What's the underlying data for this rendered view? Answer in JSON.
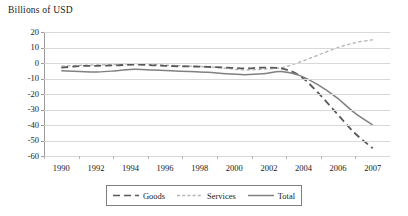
{
  "chart_data": {
    "type": "line",
    "title": "Billions of USD",
    "xlabel": "",
    "ylabel": "Billions of USD",
    "ylim": [
      -60,
      20
    ],
    "ytick_labels": [
      "20",
      "10",
      "0",
      "-10",
      "-20",
      "-30",
      "-40",
      "-50",
      "-60"
    ],
    "ytick_values": [
      20,
      10,
      0,
      -10,
      -20,
      -30,
      -40,
      -50,
      -60
    ],
    "xtick_labels": [
      "1990",
      "1992",
      "1994",
      "1996",
      "1998",
      "2000",
      "2002",
      "2004",
      "2006",
      "2007"
    ],
    "x": [
      1990,
      1991,
      1992,
      1993,
      1994,
      1995,
      1996,
      1997,
      1998,
      1999,
      2000,
      2001,
      2002,
      2003,
      2004,
      2005,
      2006,
      2007
    ],
    "grid": true,
    "legend_position": "bottom",
    "series": [
      {
        "name": "Goods",
        "style": "dashed",
        "color": "#595959",
        "values": [
          -3.0,
          -2.0,
          -1.8,
          -1.5,
          -1.0,
          -1.5,
          -2.0,
          -2.2,
          -2.5,
          -3.0,
          -3.5,
          -3.0,
          -3.5,
          -8.0,
          -19.0,
          -32.0,
          -45.0,
          -55.0
        ]
      },
      {
        "name": "Services",
        "style": "fine-dashed",
        "color": "#b3b3b3",
        "values": [
          -2.0,
          -1.5,
          -1.2,
          -1.0,
          -0.5,
          -1.0,
          -1.5,
          -2.0,
          -2.5,
          -3.5,
          -4.5,
          -4.0,
          -3.0,
          0.5,
          5.0,
          9.5,
          13.0,
          15.0
        ]
      },
      {
        "name": "Total",
        "style": "solid",
        "color": "#808080",
        "values": [
          -5.0,
          -5.5,
          -5.8,
          -5.0,
          -4.0,
          -4.5,
          -5.0,
          -5.5,
          -6.0,
          -7.0,
          -7.5,
          -7.0,
          -5.5,
          -8.0,
          -14.0,
          -22.0,
          -32.0,
          -40.0
        ]
      }
    ]
  },
  "legend": {
    "items": [
      {
        "label": "Goods"
      },
      {
        "label": "Services"
      },
      {
        "label": "Total"
      }
    ]
  }
}
